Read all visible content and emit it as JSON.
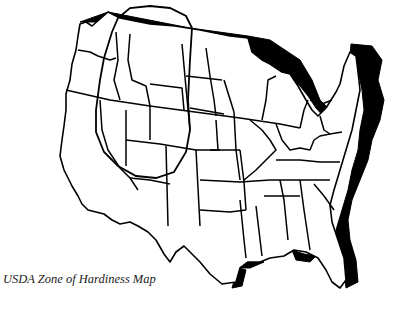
{
  "caption": "USDA Zone of Hardiness Map",
  "map": {
    "subject": "Contiguous United States state outline map",
    "style": "black-and-white line drawing with drop shadow",
    "annotation": "hand-drawn loop outlining a western/mountain region",
    "colors": {
      "lines": "#000000",
      "background": "#ffffff",
      "text": "#1a1a1a"
    }
  }
}
